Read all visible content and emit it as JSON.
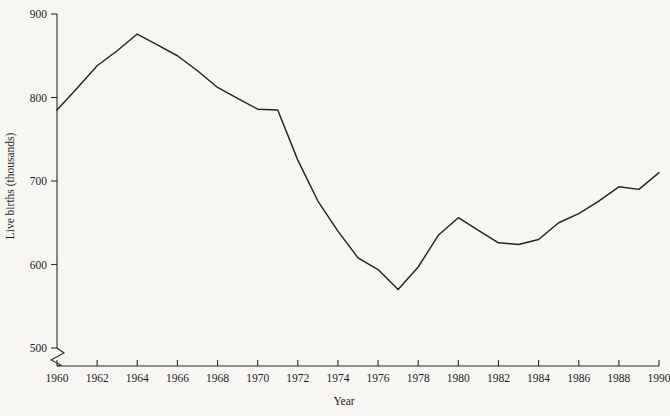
{
  "chart_data": {
    "type": "line",
    "title": "",
    "subtitle": "",
    "xlabel": "Year",
    "ylabel": "Live births (thousands)",
    "xlim": [
      1960,
      1990
    ],
    "ylim": [
      480,
      900
    ],
    "grid": false,
    "legend": null,
    "axis_break": {
      "axis": "y",
      "below": 500,
      "style": "zigzag"
    },
    "ytick_labels": [
      "500",
      "600",
      "700",
      "800",
      "900"
    ],
    "yticks": [
      500,
      600,
      700,
      800,
      900
    ],
    "xtick_labels": [
      "1960",
      "1962",
      "1964",
      "1966",
      "1968",
      "1970",
      "1972",
      "1974",
      "1976",
      "1978",
      "1980",
      "1982",
      "1984",
      "1986",
      "1988",
      "1990"
    ],
    "xticks": [
      1960,
      1962,
      1964,
      1966,
      1968,
      1970,
      1972,
      1974,
      1976,
      1978,
      1980,
      1982,
      1984,
      1986,
      1988,
      1990
    ],
    "series": [
      {
        "name": "Live births",
        "color": "#232323",
        "x": [
          1960,
          1961,
          1962,
          1963,
          1964,
          1965,
          1966,
          1967,
          1968,
          1969,
          1970,
          1971,
          1972,
          1973,
          1974,
          1975,
          1976,
          1977,
          1978,
          1979,
          1980,
          1981,
          1982,
          1983,
          1984,
          1985,
          1986,
          1987,
          1988,
          1989,
          1990
        ],
        "values": [
          785,
          811,
          838,
          856,
          876,
          863,
          850,
          832,
          812,
          799,
          786,
          785,
          725,
          676,
          640,
          608,
          594,
          570,
          597,
          635,
          656,
          641,
          626,
          624,
          630,
          650,
          661,
          676,
          693,
          690,
          710
        ]
      }
    ]
  },
  "figure": {
    "background_color": "#f7f6f3",
    "line_color": "#232323",
    "axis_color": "#2b2b2b"
  }
}
